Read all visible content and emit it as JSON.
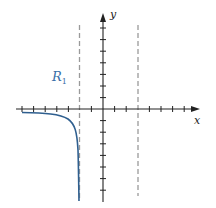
{
  "diagram": {
    "type": "coordinate-plane",
    "axes": {
      "x_label": "x",
      "y_label": "y"
    },
    "origin_px": [
      103,
      109
    ],
    "unit_px": 11.6,
    "x_ticks": [
      -8,
      -7,
      -6,
      -5,
      -4,
      -3,
      -2,
      -1,
      1,
      2,
      3,
      4,
      5,
      6,
      7
    ],
    "y_ticks": [
      -8,
      -7,
      -6,
      -5,
      -4,
      -3,
      -2,
      -1,
      1,
      2,
      3,
      4,
      5,
      6,
      7
    ],
    "asymptotes": [
      {
        "type": "vertical",
        "x": -2,
        "style": "dashed",
        "color": "#999999"
      },
      {
        "type": "vertical",
        "x": 3,
        "style": "dashed",
        "color": "#999999"
      }
    ],
    "region_label": {
      "text": "R",
      "subscript": "1",
      "color": "#3a6fa8"
    },
    "curve": {
      "color": "#2f5f8f",
      "description": "branch approaching y=0 from below as x→-∞ and diving to -∞ as x→-2 from the left"
    }
  }
}
